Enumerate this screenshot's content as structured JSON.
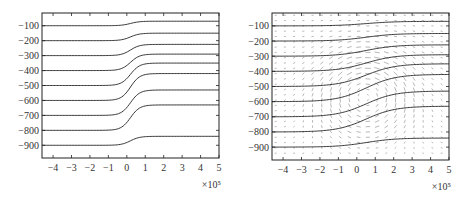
{
  "chart_data": [
    {
      "type": "line",
      "title": "",
      "xlabel": "",
      "ylabel": "",
      "x_multiplier": "×10⁵",
      "xlim": [
        -4.6,
        5
      ],
      "ylim": [
        -985,
        -15
      ],
      "xticks": [
        -4,
        -3,
        -2,
        -1,
        0,
        1,
        2,
        3,
        4,
        5
      ],
      "yticks": [
        -100,
        -200,
        -300,
        -400,
        -500,
        -600,
        -700,
        -800,
        -900
      ],
      "series": [
        {
          "name": "streamline-1",
          "left": -100,
          "right": -70
        },
        {
          "name": "streamline-2",
          "left": -200,
          "right": -150
        },
        {
          "name": "streamline-3",
          "left": -300,
          "right": -225
        },
        {
          "name": "streamline-4",
          "left": -400,
          "right": -290
        },
        {
          "name": "streamline-5",
          "left": -500,
          "right": -350
        },
        {
          "name": "streamline-6",
          "left": -600,
          "right": -420
        },
        {
          "name": "streamline-7",
          "left": -700,
          "right": -530
        },
        {
          "name": "streamline-8",
          "left": -800,
          "right": -630
        },
        {
          "name": "streamline-9",
          "left": -900,
          "right": -840
        }
      ],
      "transition_center_x": 0.2,
      "transition_width": 0.5
    },
    {
      "type": "line",
      "title": "",
      "xlabel": "",
      "ylabel": "",
      "x_multiplier": "×10⁵",
      "xlim": [
        -4.6,
        5
      ],
      "ylim": [
        -985,
        -15
      ],
      "xticks": [
        -4,
        -3,
        -2,
        -1,
        0,
        1,
        2,
        3,
        4,
        5
      ],
      "yticks": [
        -100,
        -200,
        -300,
        -400,
        -500,
        -600,
        -700,
        -800,
        -900
      ],
      "series": [
        {
          "name": "streamline-1",
          "left": -100,
          "right": -70
        },
        {
          "name": "streamline-2",
          "left": -200,
          "right": -150
        },
        {
          "name": "streamline-3",
          "left": -300,
          "right": -225
        },
        {
          "name": "streamline-4",
          "left": -400,
          "right": -290
        },
        {
          "name": "streamline-5",
          "left": -500,
          "right": -350
        },
        {
          "name": "streamline-6",
          "left": -600,
          "right": -420
        },
        {
          "name": "streamline-7",
          "left": -700,
          "right": -530
        },
        {
          "name": "streamline-8",
          "left": -800,
          "right": -630
        },
        {
          "name": "streamline-9",
          "left": -900,
          "right": -840
        }
      ],
      "transition_center_x": 0.5,
      "transition_width": 1.6,
      "overlay": "velocity quiver field, circulating vortex centered near x=0.5, y=-550"
    }
  ]
}
